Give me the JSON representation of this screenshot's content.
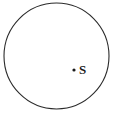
{
  "figure": {
    "type": "geometry-diagram",
    "background_color": "#ffffff",
    "stroke_color": "#2b2b2b",
    "label_color": "#1a1a1a",
    "circle": {
      "name": "circle-outline",
      "center_x": 56.5,
      "center_y": 56,
      "radius_x": 52.5,
      "radius_y": 53,
      "stroke_width": 1.1,
      "fill": "none"
    },
    "points": [
      {
        "name": "point-s",
        "label": "S",
        "dot_x": 74,
        "dot_y": 70,
        "dot_radius": 1.6,
        "label_x": 79,
        "label_y": 63
      }
    ]
  }
}
